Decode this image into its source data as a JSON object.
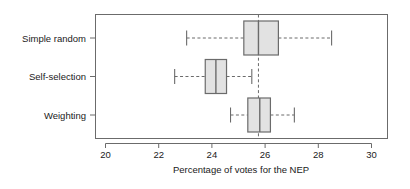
{
  "chart_data": {
    "type": "boxplot",
    "title": "",
    "xlabel": "Percentage of votes for the NEP",
    "ylabel": "",
    "orientation": "horizontal",
    "xlim": [
      19.5,
      30.65
    ],
    "xticks": [
      20,
      22,
      24,
      26,
      28,
      30
    ],
    "xticklabels": [
      "20",
      "22",
      "24",
      "26",
      "28",
      "30"
    ],
    "grid": false,
    "legend": null,
    "reference_line": {
      "value": 25.75,
      "style": "dashed",
      "color": "#6b6b6b"
    },
    "categories": [
      "Simple random",
      "Self-selection",
      "Weighting"
    ],
    "boxes": [
      {
        "label": "Simple random",
        "whisker_low": 23.05,
        "q1": 25.2,
        "median": 25.75,
        "q3": 26.5,
        "whisker_high": 28.5
      },
      {
        "label": "Self-selection",
        "whisker_low": 22.6,
        "q1": 23.75,
        "median": 24.15,
        "q3": 24.55,
        "whisker_high": 25.5
      },
      {
        "label": "Weighting",
        "whisker_low": 24.7,
        "q1": 25.35,
        "median": 25.8,
        "q3": 26.2,
        "whisker_high": 27.1
      }
    ],
    "colors": {
      "box_fill": "#e2e2e2",
      "box_stroke": "#6b6b6b",
      "text": "#1a1a1a",
      "background": "#ffffff"
    }
  }
}
